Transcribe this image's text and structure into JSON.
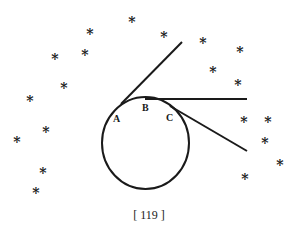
{
  "diagram": {
    "circle": {
      "cx": 145.5,
      "cy": 143,
      "rx": 43.5,
      "ry": 46
    },
    "lines": [
      {
        "name": "tangent-a",
        "x1": 121,
        "y1": 104,
        "x2": 182,
        "y2": 42
      },
      {
        "name": "tangent-b",
        "x1": 145,
        "y1": 99,
        "x2": 247,
        "y2": 99
      },
      {
        "name": "tangent-c",
        "x1": 170,
        "y1": 106,
        "x2": 247,
        "y2": 151
      }
    ],
    "labels": [
      {
        "text": "A",
        "x": 113,
        "y": 122
      },
      {
        "text": "B",
        "x": 142,
        "y": 111
      },
      {
        "text": "C",
        "x": 166,
        "y": 121
      }
    ],
    "star_glyph": "*",
    "stars": [
      [
        132,
        19
      ],
      [
        90,
        31
      ],
      [
        164,
        34
      ],
      [
        203,
        40
      ],
      [
        55,
        56
      ],
      [
        85,
        52
      ],
      [
        240,
        49
      ],
      [
        213,
        69
      ],
      [
        64,
        85
      ],
      [
        238,
        82
      ],
      [
        30,
        98
      ],
      [
        46,
        129
      ],
      [
        244,
        119
      ],
      [
        268,
        119
      ],
      [
        17,
        139
      ],
      [
        265,
        140
      ],
      [
        280,
        162
      ],
      [
        43,
        170
      ],
      [
        245,
        176
      ],
      [
        36,
        190
      ]
    ]
  },
  "footer": {
    "page_number": "[ 119 ]"
  }
}
